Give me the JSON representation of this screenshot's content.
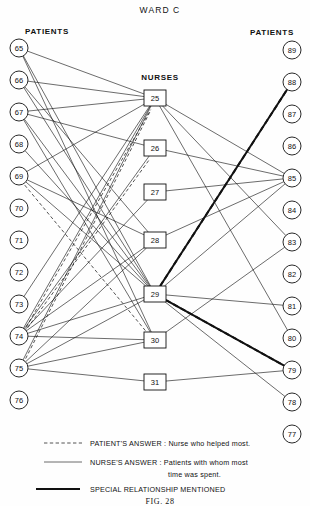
{
  "title": "WARD C",
  "figure_caption": "FIG. 28",
  "columns": {
    "left_header": "PATIENTS",
    "center_header": "NURSES",
    "right_header": "PATIENTS"
  },
  "legend": [
    {
      "style": "dashed",
      "text": "PATIENT'S ANSWER : Nurse who helped most."
    },
    {
      "style": "solid",
      "text": "NURSE'S ANSWER : Patients with whom most"
    },
    {
      "style": "none",
      "text": "time was spent."
    },
    {
      "style": "special",
      "text": "SPECIAL RELATIONSHIP MENTIONED"
    }
  ],
  "chart_data": {
    "type": "diagram",
    "subtype": "sociogram",
    "title": "WARD C",
    "node_shapes": {
      "patient": "circle",
      "nurse": "square"
    },
    "edge_types": {
      "patient_answer": "dashed - Nurse who helped most",
      "nurse_answer": "solid - Patients with whom most time was spent",
      "special": "thick solid + dashed overlay - Special relationship mentioned"
    },
    "nodes": {
      "patients_left": [
        {
          "id": "65",
          "x": 19,
          "y": 48
        },
        {
          "id": "66",
          "x": 19,
          "y": 80
        },
        {
          "id": "67",
          "x": 19,
          "y": 112
        },
        {
          "id": "68",
          "x": 19,
          "y": 144
        },
        {
          "id": "69",
          "x": 19,
          "y": 176
        },
        {
          "id": "70",
          "x": 19,
          "y": 208
        },
        {
          "id": "71",
          "x": 19,
          "y": 240
        },
        {
          "id": "72",
          "x": 19,
          "y": 272
        },
        {
          "id": "73",
          "x": 19,
          "y": 304
        },
        {
          "id": "74",
          "x": 19,
          "y": 336
        },
        {
          "id": "75",
          "x": 19,
          "y": 368
        },
        {
          "id": "76",
          "x": 19,
          "y": 400
        }
      ],
      "nurses": [
        {
          "id": "25",
          "x": 155,
          "y": 98
        },
        {
          "id": "26",
          "x": 155,
          "y": 148
        },
        {
          "id": "27",
          "x": 155,
          "y": 192
        },
        {
          "id": "28",
          "x": 155,
          "y": 240
        },
        {
          "id": "29",
          "x": 155,
          "y": 294
        },
        {
          "id": "30",
          "x": 155,
          "y": 340
        },
        {
          "id": "31",
          "x": 155,
          "y": 382
        }
      ],
      "patients_right": [
        {
          "id": "89",
          "x": 292,
          "y": 50
        },
        {
          "id": "88",
          "x": 292,
          "y": 82
        },
        {
          "id": "87",
          "x": 292,
          "y": 114
        },
        {
          "id": "86",
          "x": 292,
          "y": 146
        },
        {
          "id": "85",
          "x": 292,
          "y": 178
        },
        {
          "id": "84",
          "x": 292,
          "y": 210
        },
        {
          "id": "83",
          "x": 292,
          "y": 242
        },
        {
          "id": "82",
          "x": 292,
          "y": 274
        },
        {
          "id": "81",
          "x": 292,
          "y": 306
        },
        {
          "id": "80",
          "x": 292,
          "y": 338
        },
        {
          "id": "79",
          "x": 292,
          "y": 370
        },
        {
          "id": "78",
          "x": 292,
          "y": 402
        },
        {
          "id": "77",
          "x": 292,
          "y": 434
        }
      ]
    },
    "edges": [
      {
        "from": "65",
        "to": "25",
        "type": "nurse_answer"
      },
      {
        "from": "65",
        "to": "29",
        "type": "nurse_answer"
      },
      {
        "from": "65",
        "to": "30",
        "type": "nurse_answer"
      },
      {
        "from": "66",
        "to": "25",
        "type": "nurse_answer"
      },
      {
        "from": "66",
        "to": "28",
        "type": "nurse_answer"
      },
      {
        "from": "66",
        "to": "29",
        "type": "nurse_answer"
      },
      {
        "from": "67",
        "to": "25",
        "type": "nurse_answer"
      },
      {
        "from": "67",
        "to": "26",
        "type": "nurse_answer"
      },
      {
        "from": "67",
        "to": "29",
        "type": "nurse_answer"
      },
      {
        "from": "67",
        "to": "30",
        "type": "nurse_answer"
      },
      {
        "from": "68",
        "to": "29",
        "type": "nurse_answer"
      },
      {
        "from": "69",
        "to": "25",
        "type": "nurse_answer"
      },
      {
        "from": "69",
        "to": "28",
        "type": "nurse_answer"
      },
      {
        "from": "69",
        "to": "29",
        "type": "nurse_answer"
      },
      {
        "from": "69",
        "to": "30",
        "type": "patient_answer"
      },
      {
        "from": "73",
        "to": "25",
        "type": "nurse_answer"
      },
      {
        "from": "74",
        "to": "25",
        "type": "nurse_answer"
      },
      {
        "from": "74",
        "to": "26",
        "type": "nurse_answer"
      },
      {
        "from": "74",
        "to": "27",
        "type": "nurse_answer"
      },
      {
        "from": "74",
        "to": "28",
        "type": "nurse_answer"
      },
      {
        "from": "74",
        "to": "29",
        "type": "nurse_answer"
      },
      {
        "from": "74",
        "to": "30",
        "type": "nurse_answer"
      },
      {
        "from": "74",
        "to": "25",
        "type": "patient_answer"
      },
      {
        "from": "74",
        "to": "26",
        "type": "patient_answer"
      },
      {
        "from": "75",
        "to": "25",
        "type": "nurse_answer"
      },
      {
        "from": "75",
        "to": "28",
        "type": "nurse_answer"
      },
      {
        "from": "75",
        "to": "29",
        "type": "nurse_answer"
      },
      {
        "from": "75",
        "to": "30",
        "type": "nurse_answer"
      },
      {
        "from": "75",
        "to": "31",
        "type": "nurse_answer"
      },
      {
        "from": "75",
        "to": "25",
        "type": "patient_answer"
      },
      {
        "from": "25",
        "to": "85",
        "type": "nurse_answer"
      },
      {
        "from": "25",
        "to": "83",
        "type": "nurse_answer"
      },
      {
        "from": "25",
        "to": "80",
        "type": "nurse_answer"
      },
      {
        "from": "26",
        "to": "85",
        "type": "nurse_answer"
      },
      {
        "from": "27",
        "to": "85",
        "type": "nurse_answer"
      },
      {
        "from": "28",
        "to": "85",
        "type": "nurse_answer"
      },
      {
        "from": "29",
        "to": "85",
        "type": "nurse_answer"
      },
      {
        "from": "29",
        "to": "81",
        "type": "nurse_answer"
      },
      {
        "from": "29",
        "to": "78",
        "type": "nurse_answer"
      },
      {
        "from": "30",
        "to": "83",
        "type": "nurse_answer"
      },
      {
        "from": "31",
        "to": "79",
        "type": "nurse_answer"
      },
      {
        "from": "29",
        "to": "88",
        "type": "special"
      },
      {
        "from": "29",
        "to": "79",
        "type": "special"
      }
    ],
    "isolated_nodes": [
      "70",
      "71",
      "72",
      "76",
      "89",
      "87",
      "86",
      "84",
      "82",
      "77"
    ]
  }
}
